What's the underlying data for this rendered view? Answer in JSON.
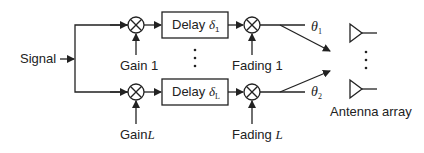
{
  "diagram": {
    "input_label": "Signal",
    "branches": [
      {
        "gain_label": "Gain",
        "gain_index": "1",
        "delay_label": "Delay",
        "delay_symbol": "δ",
        "delay_index": "1",
        "fading_label": "Fading",
        "fading_index": "1",
        "angle_symbol": "θ",
        "angle_index": "1"
      },
      {
        "gain_label": "Gain",
        "gain_index": "L",
        "delay_label": "Delay",
        "delay_symbol": "δ",
        "delay_index": "L",
        "fading_label": "Fading",
        "fading_index": "L",
        "angle_symbol": "θ",
        "angle_index": "2"
      }
    ],
    "ellipsis": "⋮",
    "output_label": "Antenna array",
    "colors": {
      "line": "#222222",
      "background": "#ffffff"
    }
  }
}
